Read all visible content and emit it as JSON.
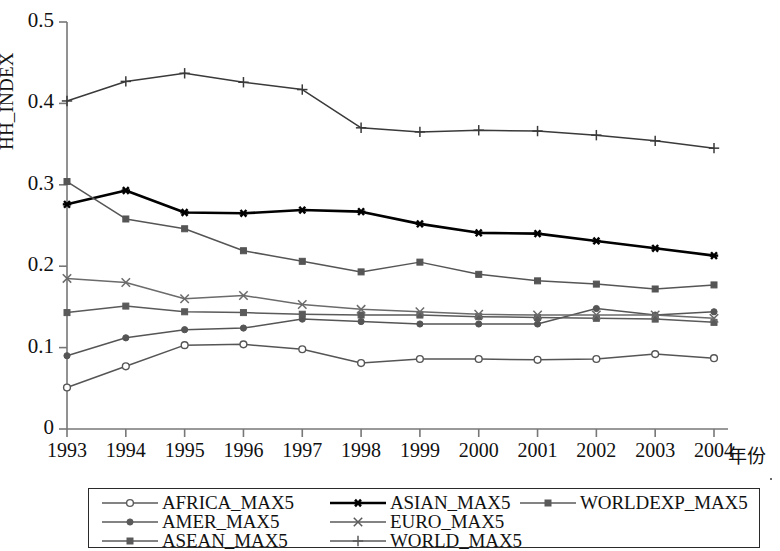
{
  "chart_data": {
    "type": "line",
    "title": "",
    "xlabel": "年份",
    "ylabel": "HH_INDEX",
    "x": [
      1993,
      1994,
      1995,
      1996,
      1997,
      1998,
      1999,
      2000,
      2001,
      2002,
      2003,
      2004
    ],
    "xtick_labels": [
      "1993",
      "1994",
      "1995",
      "1996",
      "1997",
      "1998",
      "1999",
      "2000",
      "2001",
      "2002",
      "2003",
      "2004"
    ],
    "ytick_labels": [
      "0.5",
      "0.4",
      "0.3",
      "0.2",
      "0.1",
      "0"
    ],
    "ytick_values": [
      0.5,
      0.4,
      0.3,
      0.2,
      0.1,
      0
    ],
    "xlim": [
      1993,
      2004
    ],
    "ylim": [
      0,
      0.5
    ],
    "grid": false,
    "legend_position": "below-plot",
    "series": [
      {
        "name": "AFRICA_MAX5",
        "marker": "circle-open",
        "color": "#555555",
        "values": [
          0.051,
          0.077,
          0.103,
          0.104,
          0.098,
          0.081,
          0.086,
          0.086,
          0.085,
          0.086,
          0.092,
          0.087
        ]
      },
      {
        "name": "AMER_MAX5",
        "marker": "circle-filled",
        "color": "#555555",
        "values": [
          0.09,
          0.112,
          0.122,
          0.124,
          0.135,
          0.132,
          0.129,
          0.129,
          0.129,
          0.148,
          0.14,
          0.144
        ]
      },
      {
        "name": "ASEAN_MAX5",
        "marker": "square-filled",
        "color": "#5a5a5a",
        "values": [
          0.143,
          0.151,
          0.144,
          0.143,
          0.141,
          0.14,
          0.14,
          0.138,
          0.137,
          0.136,
          0.135,
          0.131
        ]
      },
      {
        "name": "ASIAN_MAX5",
        "marker": "asterisk",
        "color": "#000000",
        "values": [
          0.276,
          0.293,
          0.266,
          0.265,
          0.269,
          0.267,
          0.252,
          0.241,
          0.24,
          0.231,
          0.222,
          0.213
        ]
      },
      {
        "name": "EURO_MAX5",
        "marker": "x-cross",
        "color": "#6b6b6b",
        "values": [
          0.185,
          0.18,
          0.16,
          0.164,
          0.153,
          0.147,
          0.144,
          0.141,
          0.14,
          0.14,
          0.14,
          0.136
        ]
      },
      {
        "name": "WORLDEXP_MAX5",
        "marker": "square-filled",
        "color": "#555555",
        "values": [
          0.304,
          0.258,
          0.246,
          0.219,
          0.206,
          0.193,
          0.205,
          0.19,
          0.182,
          0.178,
          0.172,
          0.177
        ]
      },
      {
        "name": "WORLD_MAX5",
        "marker": "plus",
        "color": "#3a3a3a",
        "values": [
          0.403,
          0.427,
          0.437,
          0.426,
          0.417,
          0.37,
          0.365,
          0.367,
          0.366,
          0.361,
          0.354,
          0.345
        ]
      }
    ]
  },
  "axes": {
    "y_title": "HH_INDEX",
    "x_unit_label": "年份"
  },
  "legend": {
    "entries": [
      {
        "label": "AFRICA_MAX5",
        "marker": "circle-open",
        "col": 0,
        "row": 0
      },
      {
        "label": "ASIAN_MAX5",
        "marker": "asterisk",
        "col": 1,
        "row": 0
      },
      {
        "label": "WORLDEXP_MAX5",
        "marker": "square-filled",
        "col": 2,
        "row": 0
      },
      {
        "label": "AMER_MAX5",
        "marker": "circle-filled",
        "col": 0,
        "row": 1
      },
      {
        "label": "EURO_MAX5",
        "marker": "x-cross",
        "col": 1,
        "row": 1
      },
      {
        "label": "ASEAN_MAX5",
        "marker": "square-filled",
        "col": 0,
        "row": 2
      },
      {
        "label": "WORLD_MAX5",
        "marker": "plus",
        "col": 1,
        "row": 2
      }
    ]
  },
  "style": {
    "axis_color": "#777777",
    "plot_background": "#ffffff"
  }
}
